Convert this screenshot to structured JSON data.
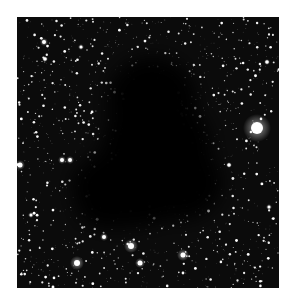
{
  "image": {
    "subject": "dark nebula against dense star field",
    "frame": {
      "x": 17,
      "y": 17,
      "width": 262,
      "height": 271
    },
    "background_color": "#0b0b0b",
    "cloud_color": "#050505",
    "star_color": "#ffffff",
    "cloud": {
      "blobs": [
        {
          "cx": 135,
          "cy": 85,
          "rx": 45,
          "ry": 45
        },
        {
          "cx": 140,
          "cy": 130,
          "rx": 55,
          "ry": 50
        },
        {
          "cx": 115,
          "cy": 170,
          "rx": 60,
          "ry": 40
        },
        {
          "cx": 165,
          "cy": 165,
          "rx": 40,
          "ry": 38
        },
        {
          "cx": 95,
          "cy": 190,
          "rx": 35,
          "ry": 22
        }
      ]
    },
    "bright_stars": [
      {
        "x": 240,
        "y": 111,
        "r": 6,
        "glow": 14
      },
      {
        "x": 114,
        "y": 229,
        "r": 3,
        "glow": 7
      },
      {
        "x": 60,
        "y": 246,
        "r": 3,
        "glow": 7
      },
      {
        "x": 123,
        "y": 246,
        "r": 2.5,
        "glow": 5
      },
      {
        "x": 166,
        "y": 238,
        "r": 2.5,
        "glow": 6
      },
      {
        "x": 87,
        "y": 220,
        "r": 2,
        "glow": 4
      },
      {
        "x": 3,
        "y": 148,
        "r": 2.5,
        "glow": 5
      },
      {
        "x": 45,
        "y": 143,
        "r": 2,
        "glow": 4
      },
      {
        "x": 53,
        "y": 143,
        "r": 2,
        "glow": 4
      },
      {
        "x": 27,
        "y": 25,
        "r": 2,
        "glow": 4
      },
      {
        "x": 28,
        "y": 42,
        "r": 1.8,
        "glow": 3
      },
      {
        "x": 64,
        "y": 30,
        "r": 1.5,
        "glow": 3
      },
      {
        "x": 250,
        "y": 45,
        "r": 1.8,
        "glow": 3
      },
      {
        "x": 212,
        "y": 148,
        "r": 1.8,
        "glow": 3
      },
      {
        "x": 252,
        "y": 190,
        "r": 1.5,
        "glow": 3
      },
      {
        "x": 14,
        "y": 198,
        "r": 1.5,
        "glow": 3
      }
    ],
    "field_star_count": 1400,
    "seed": 42
  }
}
